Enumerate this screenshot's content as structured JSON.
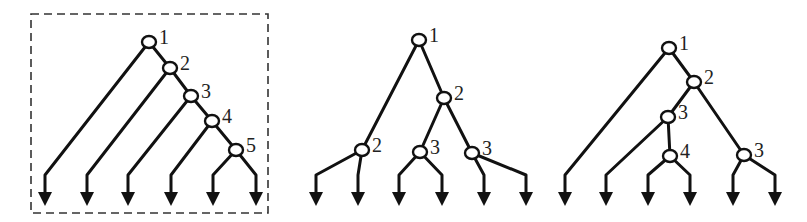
{
  "diagram": {
    "stroke_color": "#111111",
    "background": "#ffffff",
    "trees": [
      {
        "id": "chain-tree",
        "framed": true,
        "frame": {
          "x": 31,
          "y": 14,
          "w": 237,
          "h": 199,
          "style": "dashed"
        },
        "nodes": [
          {
            "id": "a1",
            "x": 149,
            "y": 42,
            "label": "1"
          },
          {
            "id": "a2",
            "x": 170,
            "y": 68,
            "label": "2"
          },
          {
            "id": "a3",
            "x": 191,
            "y": 96,
            "label": "3"
          },
          {
            "id": "a4",
            "x": 212,
            "y": 121,
            "label": "4"
          },
          {
            "id": "a5",
            "x": 236,
            "y": 150,
            "label": "5"
          }
        ],
        "edges": [
          {
            "from": "a1",
            "to": "a2"
          },
          {
            "from": "a2",
            "to": "a3"
          },
          {
            "from": "a3",
            "to": "a4"
          },
          {
            "from": "a4",
            "to": "a5"
          }
        ],
        "leaves": [
          {
            "from": "a1",
            "x": 45
          },
          {
            "from": "a2",
            "x": 87
          },
          {
            "from": "a3",
            "x": 128
          },
          {
            "from": "a4",
            "x": 171
          },
          {
            "from": "a5",
            "x": 213
          },
          {
            "from": "a5",
            "x": 256
          }
        ]
      },
      {
        "id": "balanced-tree",
        "framed": false,
        "nodes": [
          {
            "id": "b1",
            "x": 419,
            "y": 40,
            "label": "1"
          },
          {
            "id": "b2",
            "x": 444,
            "y": 98,
            "label": "2"
          },
          {
            "id": "b2l",
            "x": 362,
            "y": 150,
            "label": "2"
          },
          {
            "id": "b3m",
            "x": 420,
            "y": 152,
            "label": "3"
          },
          {
            "id": "b3r",
            "x": 472,
            "y": 153,
            "label": "3"
          }
        ],
        "edges": [
          {
            "from": "b1",
            "to": "b2"
          },
          {
            "from": "b1",
            "to": "b2l"
          },
          {
            "from": "b2",
            "to": "b3m"
          },
          {
            "from": "b2",
            "to": "b3r"
          }
        ],
        "leaves": [
          {
            "from": "b2l",
            "x": 316
          },
          {
            "from": "b2l",
            "x": 358
          },
          {
            "from": "b3m",
            "x": 399
          },
          {
            "from": "b3m",
            "x": 442
          },
          {
            "from": "b3r",
            "x": 484
          },
          {
            "from": "b3r",
            "x": 526
          }
        ]
      },
      {
        "id": "mixed-tree",
        "framed": false,
        "nodes": [
          {
            "id": "c1",
            "x": 669,
            "y": 48,
            "label": "1"
          },
          {
            "id": "c2",
            "x": 694,
            "y": 82,
            "label": "2"
          },
          {
            "id": "c3",
            "x": 668,
            "y": 117,
            "label": "3"
          },
          {
            "id": "c4",
            "x": 670,
            "y": 156,
            "label": "4"
          },
          {
            "id": "c3r",
            "x": 744,
            "y": 155,
            "label": "3"
          }
        ],
        "edges": [
          {
            "from": "c1",
            "to": "c2"
          },
          {
            "from": "c2",
            "to": "c3"
          },
          {
            "from": "c3",
            "to": "c4"
          },
          {
            "from": "c2",
            "to": "c3r"
          }
        ],
        "leaves": [
          {
            "from": "c1",
            "x": 565
          },
          {
            "from": "c3",
            "x": 606
          },
          {
            "from": "c4",
            "x": 648
          },
          {
            "from": "c4",
            "x": 690
          },
          {
            "from": "c3r",
            "x": 733
          },
          {
            "from": "c3r",
            "x": 775
          }
        ]
      }
    ],
    "leaf_bend_y": 175,
    "leaf_tip_y": 205
  }
}
